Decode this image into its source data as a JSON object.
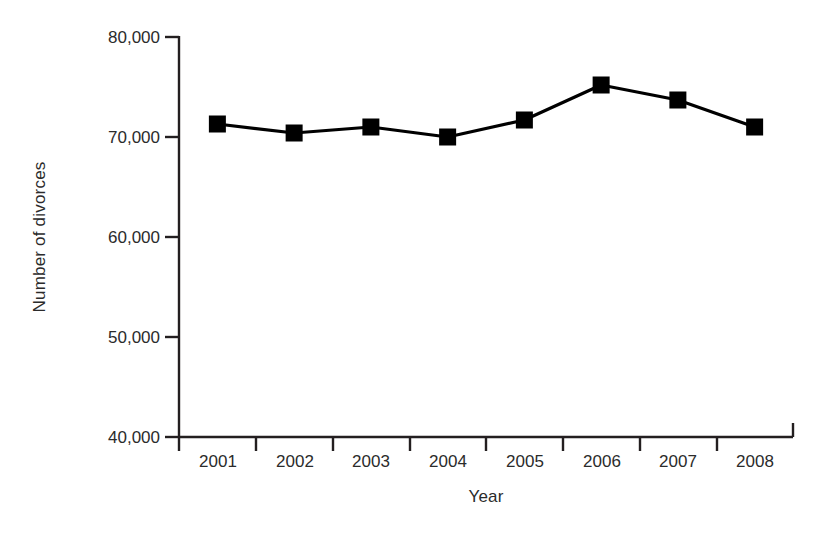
{
  "chart_data": {
    "type": "line",
    "title": "",
    "xlabel": "Year",
    "ylabel": "Number of divorces",
    "categories": [
      "2001",
      "2002",
      "2003",
      "2004",
      "2005",
      "2006",
      "2007",
      "2008"
    ],
    "values": [
      71300,
      70400,
      71000,
      70000,
      71700,
      75200,
      73700,
      71000
    ],
    "series": [
      {
        "name": "Number of divorces",
        "values": [
          71300,
          70400,
          71000,
          70000,
          71700,
          75200,
          73700,
          71000
        ]
      }
    ],
    "ylim": [
      40000,
      80000
    ],
    "ytick_values": [
      40000,
      50000,
      60000,
      70000,
      80000
    ],
    "ytick_labels": [
      "40,000",
      "50,000",
      "60,000",
      "70,000",
      "80,000"
    ],
    "xtick_labels": [
      "2001",
      "2002",
      "2003",
      "2004",
      "2005",
      "2006",
      "2007",
      "2008"
    ],
    "grid": false,
    "legend": "none",
    "marker": "square",
    "line_color": "#000000",
    "marker_color": "#000000",
    "background_color": "#ffffff",
    "axis_color": "#231f20"
  }
}
